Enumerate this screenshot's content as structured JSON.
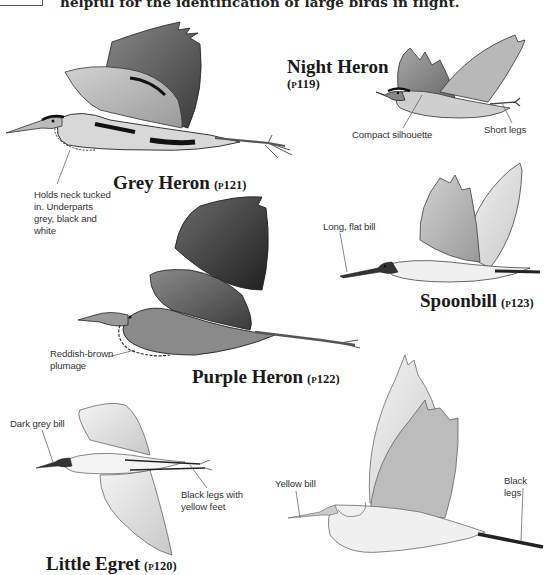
{
  "header": {
    "intro_text": "helpful for the identification of large birds in flight."
  },
  "species": [
    {
      "id": "grey-heron",
      "name": "Grey Heron",
      "page_ref": "(p121)",
      "annotations": [
        "Holds neck tucked in. Underparts grey, black and white"
      ]
    },
    {
      "id": "night-heron",
      "name": "Night Heron",
      "page_ref": "(p119)",
      "annotations": [
        "Compact silhouette",
        "Short legs"
      ]
    },
    {
      "id": "spoonbill",
      "name": "Spoonbill",
      "page_ref": "(p123)",
      "annotations": [
        "Long, flat bill"
      ]
    },
    {
      "id": "purple-heron",
      "name": "Purple Heron",
      "page_ref": "(p122)",
      "annotations": [
        "Reddish-brown plumage"
      ]
    },
    {
      "id": "little-egret",
      "name": "Little Egret",
      "page_ref": "(p120)",
      "annotations": [
        "Dark grey bill",
        "Black legs with yellow feet"
      ]
    },
    {
      "id": "great-white-egret",
      "name": "",
      "page_ref": "",
      "annotations": [
        "Yellow bill",
        "Black legs"
      ]
    }
  ],
  "notes": {
    "grey_heron_l1": "Holds neck tucked",
    "grey_heron_l2": "in. Underparts",
    "grey_heron_l3": "grey, black and",
    "grey_heron_l4": "white",
    "night_heron_a": "Compact silhouette",
    "night_heron_b": "Short legs",
    "spoonbill_a": "Long, flat bill",
    "purple_heron_l1": "Reddish-brown",
    "purple_heron_l2": "plumage",
    "little_egret_a": "Dark grey bill",
    "little_egret_b1": "Black legs with",
    "little_egret_b2": "yellow feet",
    "great_egret_a": "Yellow bill",
    "great_egret_b": "Black legs"
  }
}
